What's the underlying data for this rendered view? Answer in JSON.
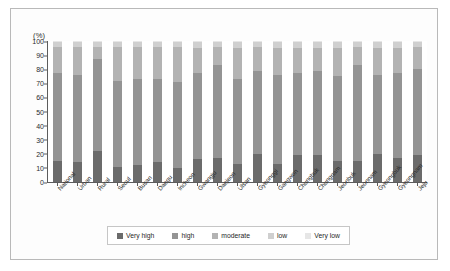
{
  "chart_data": {
    "type": "bar",
    "subtype": "stacked-percentage",
    "title": "",
    "subtitle": "",
    "xlabel": "",
    "ylabel": "(%)",
    "ylim": [
      0,
      100
    ],
    "yticks": [
      0,
      10,
      20,
      30,
      40,
      50,
      60,
      70,
      80,
      90,
      100
    ],
    "grid": false,
    "legend_position": "bottom",
    "categories": [
      "National",
      "Urban",
      "Rural",
      "Seoul",
      "Busan",
      "Daegu",
      "Incheon",
      "Gwangju",
      "Daejeon",
      "Ulsan",
      "Gyeonggi",
      "Gangwon",
      "Chungbuk",
      "Chungnam",
      "Jeonbuk",
      "Jeonnam",
      "Gyeongbuk",
      "Gyeongnam",
      "Jeju"
    ],
    "series": [
      {
        "name": "Very high",
        "color": "#6b6b6b",
        "values": [
          15,
          14,
          22,
          11,
          12,
          14,
          10,
          16,
          17,
          13,
          20,
          13,
          19,
          19,
          15,
          15,
          20,
          17,
          19
        ]
      },
      {
        "name": "high",
        "color": "#949494",
        "values": [
          62,
          62,
          65,
          61,
          61,
          59,
          61,
          61,
          66,
          60,
          59,
          63,
          58,
          60,
          60,
          68,
          56,
          60,
          61
        ]
      },
      {
        "name": "moderate",
        "color": "#b3b3b3",
        "values": [
          19,
          20,
          9,
          24,
          23,
          23,
          25,
          18,
          13,
          22,
          17,
          19,
          18,
          16,
          20,
          13,
          19,
          18,
          16
        ]
      },
      {
        "name": "low",
        "color": "#cfcfcf",
        "values": [
          3,
          3,
          3,
          3,
          3,
          3,
          3,
          4,
          3,
          4,
          3,
          4,
          4,
          4,
          4,
          3,
          4,
          4,
          3
        ]
      },
      {
        "name": "Very low",
        "color": "#e6e6e6",
        "values": [
          1,
          1,
          1,
          1,
          1,
          1,
          1,
          1,
          1,
          1,
          1,
          1,
          1,
          1,
          1,
          1,
          1,
          1,
          1
        ]
      }
    ]
  }
}
